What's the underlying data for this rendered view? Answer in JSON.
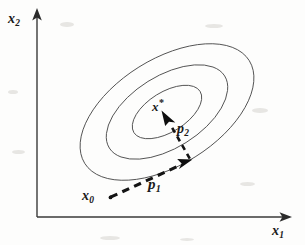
{
  "figure": {
    "width": 305,
    "height": 245,
    "background_color": "#fdfdfc",
    "line_color": "#4a4a4a",
    "axis_color": "#3a3a3a",
    "vector_color": "#141414"
  },
  "axes": {
    "x_label": "x",
    "x_label_sub": "1",
    "y_label": "x",
    "y_label_sub": "2",
    "origin": {
      "x": 37,
      "y": 217
    },
    "x_axis_end": {
      "x": 290,
      "y": 217
    },
    "y_axis_end": {
      "x": 37,
      "y": 10
    },
    "arrowheads": "solid filled triangles at both axis ends",
    "ticks": "none",
    "grid": "off"
  },
  "contours": {
    "description": "three concentric rotated ellipses representing level sets of a quadratic objective",
    "count": 3,
    "center": {
      "x": 167,
      "y": 112
    },
    "rotation_degrees": -32,
    "levels": [
      {
        "name": "outer-contour",
        "rx": 97,
        "ry": 53
      },
      {
        "name": "middle-contour",
        "rx": 68,
        "ry": 36
      },
      {
        "name": "inner-contour",
        "rx": 39,
        "ry": 20
      }
    ]
  },
  "points": [
    {
      "name": "start-point",
      "label": "x",
      "label_sub": "0",
      "label_star": "",
      "x": 110,
      "y": 197,
      "description": "initial iterate"
    },
    {
      "name": "optimum-point",
      "label": "x",
      "label_sub": "",
      "label_star": "*",
      "x": 167,
      "y": 112,
      "description": "minimizer at contour center"
    }
  ],
  "vectors": [
    {
      "name": "search-direction-1",
      "label": "p",
      "label_sub": "1",
      "style": "dashed-with-solid-arrowhead",
      "from": {
        "x": 110,
        "y": 197
      },
      "to": {
        "x": 190,
        "y": 160
      },
      "label_position": {
        "x": 148,
        "y": 176
      }
    },
    {
      "name": "search-direction-2",
      "label": "p",
      "label_sub": "2",
      "style": "dashed-with-solid-arrowhead",
      "from": {
        "x": 190,
        "y": 160
      },
      "to": {
        "x": 163,
        "y": 113
      },
      "label_position": {
        "x": 177,
        "y": 121
      }
    }
  ]
}
